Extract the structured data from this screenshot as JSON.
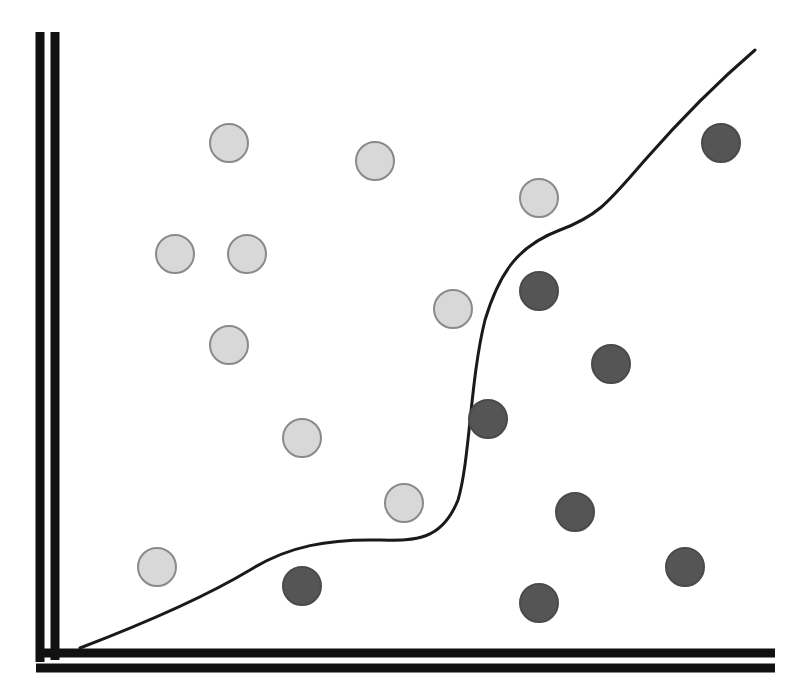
{
  "diagram": {
    "title": "",
    "canvas": {
      "width": 799,
      "height": 690
    },
    "colors": {
      "background": "#ffffff",
      "axis": "#111111",
      "boundary": "#1a1a1a",
      "class_a_fill": "#d8d8d8",
      "class_a_stroke": "#8a8a8a",
      "class_b_fill": "#555555",
      "class_b_stroke": "#4a4a4a"
    },
    "axes": {
      "y_axis_lines": [
        {
          "x": 40,
          "y1": 32,
          "y2": 662,
          "width": 9
        },
        {
          "x": 55,
          "y1": 32,
          "y2": 660,
          "width": 9
        }
      ],
      "x_axis_lines": [
        {
          "y": 653,
          "x1": 36,
          "x2": 775,
          "width": 9
        },
        {
          "y": 668,
          "x1": 36,
          "x2": 775,
          "width": 9
        }
      ]
    },
    "point_radius": 19,
    "class_a_points": [
      {
        "x": 229,
        "y": 143
      },
      {
        "x": 375,
        "y": 161
      },
      {
        "x": 539,
        "y": 198
      },
      {
        "x": 175,
        "y": 254
      },
      {
        "x": 247,
        "y": 254
      },
      {
        "x": 453,
        "y": 309
      },
      {
        "x": 229,
        "y": 345
      },
      {
        "x": 302,
        "y": 438
      },
      {
        "x": 404,
        "y": 503
      },
      {
        "x": 157,
        "y": 567
      }
    ],
    "class_b_points": [
      {
        "x": 721,
        "y": 143
      },
      {
        "x": 539,
        "y": 291
      },
      {
        "x": 611,
        "y": 364
      },
      {
        "x": 488,
        "y": 419
      },
      {
        "x": 575,
        "y": 512
      },
      {
        "x": 685,
        "y": 567
      },
      {
        "x": 302,
        "y": 586
      },
      {
        "x": 539,
        "y": 603
      }
    ],
    "boundary_path": "M 80 648 C 140 625, 200 600, 250 570 C 290 545, 330 540, 370 540 C 410 540, 440 545, 458 500 C 470 460, 470 380, 485 320 C 500 270, 520 245, 560 230 C 600 215, 610 200, 645 160 C 680 120, 720 80, 755 50"
  }
}
